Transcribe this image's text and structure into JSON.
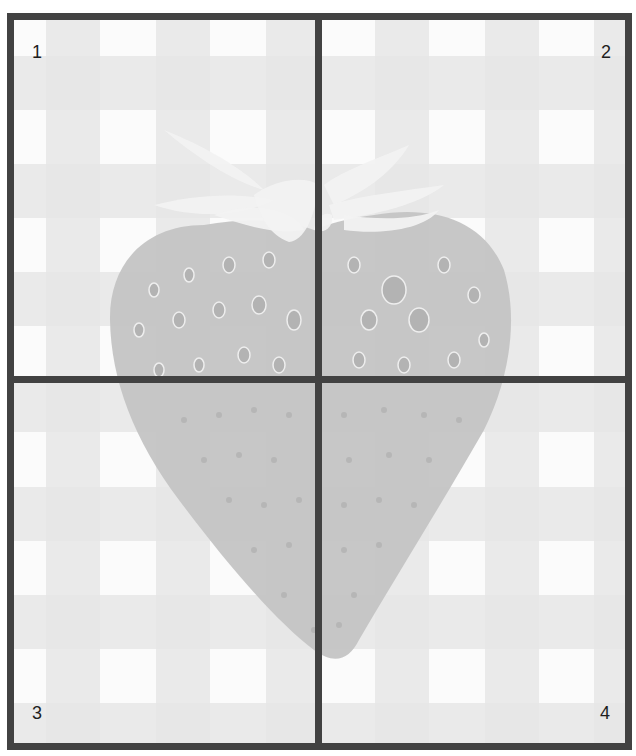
{
  "image": {
    "subject": "strawberry on gingham tablecloth",
    "style": "grayscale, faded",
    "grid": {
      "rows": 2,
      "cols": 2,
      "line_color": "#424242"
    }
  },
  "quadrants": [
    {
      "label": "1",
      "position": "top-left"
    },
    {
      "label": "2",
      "position": "top-right"
    },
    {
      "label": "3",
      "position": "bottom-left"
    },
    {
      "label": "4",
      "position": "bottom-right"
    }
  ],
  "colors": {
    "background": "#fbfbfb",
    "band": "#e6e6e6",
    "band_cross": "#d3d3d3",
    "strawberry_body": "#c4c4c4",
    "strawberry_seed": "#b0b0b0",
    "seed_highlight": "#efefef",
    "leaves": "#f1f1f1"
  }
}
